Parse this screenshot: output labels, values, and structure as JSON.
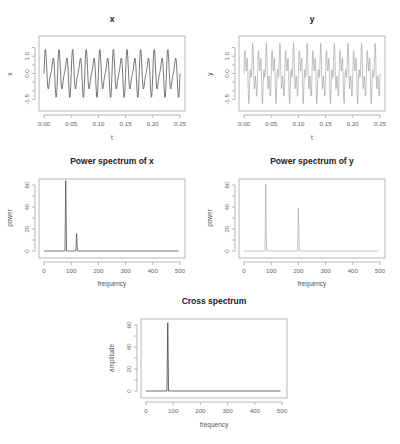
{
  "chart_data": [
    {
      "id": "p1",
      "type": "line",
      "title": "x",
      "xlabel": "t",
      "ylabel": "x",
      "xlim": [
        0,
        0.25
      ],
      "ylim": [
        -1.75,
        1.75
      ],
      "x_ticks": [
        "0.00",
        "0.05",
        "0.10",
        "0.15",
        "0.20",
        "0.25"
      ],
      "y_ticks": [
        "-1.5",
        "0.0",
        "1.0"
      ],
      "signal": {
        "components": [
          {
            "freq": 80,
            "amp": 1.0
          },
          {
            "freq": 120,
            "amp": 0.5
          }
        ],
        "range": [
          -1.5,
          1.2
        ]
      },
      "grid": false,
      "color": "#555555"
    },
    {
      "id": "p2",
      "type": "line",
      "title": "y",
      "xlabel": "t",
      "ylabel": "y",
      "xlim": [
        0,
        0.25
      ],
      "ylim": [
        -1.75,
        1.75
      ],
      "x_ticks": [
        "0.00",
        "0.05",
        "0.10",
        "0.15",
        "0.20",
        "0.25"
      ],
      "y_ticks": [
        "-1.5",
        "0.0",
        "1.0"
      ],
      "signal": {
        "components": [
          {
            "freq": 80,
            "amp": 1.0
          },
          {
            "freq": 200,
            "amp": 0.8
          }
        ],
        "range": [
          -1.6,
          1.6
        ]
      },
      "grid": false,
      "color": "#888888"
    },
    {
      "id": "p3",
      "type": "line",
      "title": "Power spectrum of x",
      "xlabel": "frequency",
      "ylabel": "power",
      "xlim": [
        0,
        500
      ],
      "ylim": [
        0,
        64
      ],
      "x_ticks": [
        "0",
        "100",
        "200",
        "300",
        "400",
        "500"
      ],
      "y_ticks": [
        "0",
        "20",
        "40",
        "60"
      ],
      "peaks": [
        {
          "x": 80,
          "y": 64
        },
        {
          "x": 120,
          "y": 16
        }
      ],
      "baseline": 0,
      "grid": false,
      "color": "#555555"
    },
    {
      "id": "p4",
      "type": "line",
      "title": "Power spectrum of y",
      "xlabel": "frequency",
      "ylabel": "power",
      "xlim": [
        0,
        500
      ],
      "ylim": [
        0,
        64
      ],
      "x_ticks": [
        "0",
        "100",
        "200",
        "300",
        "400",
        "500"
      ],
      "y_ticks": [
        "0",
        "20",
        "40",
        "60"
      ],
      "peaks": [
        {
          "x": 80,
          "y": 61
        },
        {
          "x": 200,
          "y": 39
        }
      ],
      "baseline": 0,
      "grid": false,
      "color": "#aaaaaa"
    },
    {
      "id": "p5",
      "type": "line",
      "title": "Cross spectrum",
      "xlabel": "frequency",
      "ylabel": "amplitude",
      "xlim": [
        0,
        500
      ],
      "ylim": [
        0,
        64
      ],
      "x_ticks": [
        "0",
        "100",
        "200",
        "300",
        "400",
        "500"
      ],
      "y_ticks": [
        "0",
        "20",
        "40",
        "60"
      ],
      "peaks": [
        {
          "x": 80,
          "y": 62
        }
      ],
      "baseline": 0,
      "grid": false,
      "color": "#444444"
    }
  ]
}
